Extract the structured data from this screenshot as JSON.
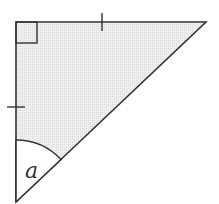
{
  "diagram": {
    "type": "right-isosceles-triangle",
    "fill_color": "#ebebeb",
    "stroke_color": "#333333",
    "vertices": {
      "right_angle": [
        16,
        22
      ],
      "top_right": [
        206,
        22
      ],
      "bottom": [
        16,
        202
      ]
    },
    "right_angle_marker": true,
    "equal_side_ticks": [
      "top",
      "left"
    ],
    "angle_label": "a"
  }
}
